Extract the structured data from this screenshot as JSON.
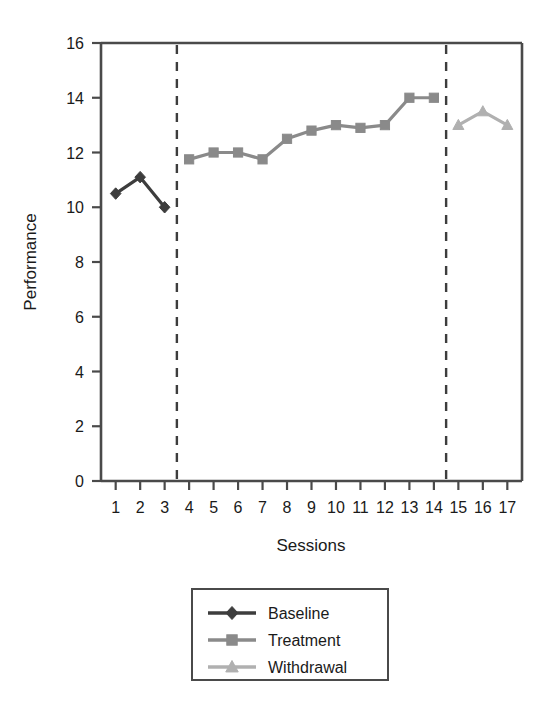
{
  "chart_data": {
    "type": "line",
    "title": "",
    "xlabel": "Sessions",
    "ylabel": "Performance",
    "xlim": [
      0.4,
      17.6
    ],
    "ylim": [
      0,
      16
    ],
    "ytick_step": 2,
    "yticks": [
      0,
      2,
      4,
      6,
      8,
      10,
      12,
      14,
      16
    ],
    "xticks": [
      1,
      2,
      3,
      4,
      5,
      6,
      7,
      8,
      9,
      10,
      11,
      12,
      13,
      14,
      15,
      16,
      17
    ],
    "grid": false,
    "legend_position": "below-center",
    "phase_lines": [
      {
        "name": "baseline-treatment-divider",
        "x": 3.5,
        "style": "dashed"
      },
      {
        "name": "treatment-withdrawal-divider",
        "x": 14.5,
        "style": "dashed"
      }
    ],
    "series": [
      {
        "name": "Baseline",
        "marker": "diamond",
        "color": "#3d3d3d",
        "x": [
          1,
          2,
          3
        ],
        "values": [
          10.5,
          11.1,
          10.0
        ]
      },
      {
        "name": "Treatment",
        "marker": "square",
        "color": "#8a8a8a",
        "x": [
          4,
          5,
          6,
          7,
          8,
          9,
          10,
          11,
          12,
          13,
          14
        ],
        "values": [
          11.75,
          12.0,
          12.0,
          11.75,
          12.5,
          12.8,
          13.0,
          12.9,
          13.0,
          14.0,
          14.0
        ]
      },
      {
        "name": "Withdrawal",
        "marker": "triangle",
        "color": "#b0b0b0",
        "x": [
          15,
          16,
          17
        ],
        "values": [
          13.0,
          13.5,
          13.0
        ]
      }
    ]
  },
  "axes": {
    "y_title": "Performance",
    "x_title": "Sessions",
    "y_tick_labels": [
      "0",
      "2",
      "4",
      "6",
      "8",
      "10",
      "12",
      "14",
      "16"
    ],
    "x_tick_labels": [
      "1",
      "2",
      "3",
      "4",
      "5",
      "6",
      "7",
      "8",
      "9",
      "10",
      "11",
      "12",
      "13",
      "14",
      "15",
      "16",
      "17"
    ]
  },
  "legend": {
    "entries": [
      {
        "label": "Baseline",
        "color": "#3d3d3d",
        "marker": "diamond"
      },
      {
        "label": "Treatment",
        "color": "#8a8a8a",
        "marker": "square"
      },
      {
        "label": "Withdrawal",
        "color": "#b0b0b0",
        "marker": "triangle"
      }
    ]
  },
  "colors": {
    "baseline": "#3d3d3d",
    "treatment": "#8a8a8a",
    "withdrawal": "#b0b0b0",
    "axis": "#4a4a4a",
    "text": "#1a1a1a",
    "background": "#ffffff"
  }
}
